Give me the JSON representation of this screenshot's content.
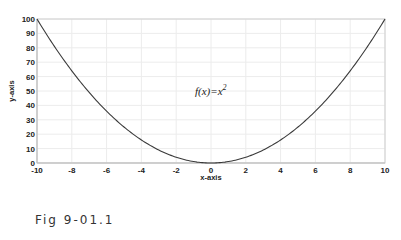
{
  "chart_data": {
    "type": "line",
    "title": "",
    "xlabel": "x-axis",
    "ylabel": "y-axis",
    "xlim": [
      -10,
      10
    ],
    "ylim": [
      0,
      100
    ],
    "xticks": [
      -10,
      -8,
      -6,
      -4,
      -2,
      0,
      2,
      4,
      6,
      8,
      10
    ],
    "yticks": [
      0,
      10,
      20,
      30,
      40,
      50,
      60,
      70,
      80,
      90,
      100
    ],
    "grid": true,
    "annotation": {
      "text": "f(x)=x",
      "superscript": "2",
      "x": 0.5,
      "y": 60
    },
    "series": [
      {
        "name": "f(x)=x^2",
        "x": [
          -10,
          -9,
          -8,
          -7,
          -6,
          -5,
          -4,
          -3,
          -2,
          -1,
          0,
          1,
          2,
          3,
          4,
          5,
          6,
          7,
          8,
          9,
          10
        ],
        "values": [
          100,
          81,
          64,
          49,
          36,
          25,
          16,
          9,
          4,
          1,
          0,
          1,
          4,
          9,
          16,
          25,
          36,
          49,
          64,
          81,
          100
        ]
      }
    ]
  },
  "caption": "Fig 9-01.1"
}
